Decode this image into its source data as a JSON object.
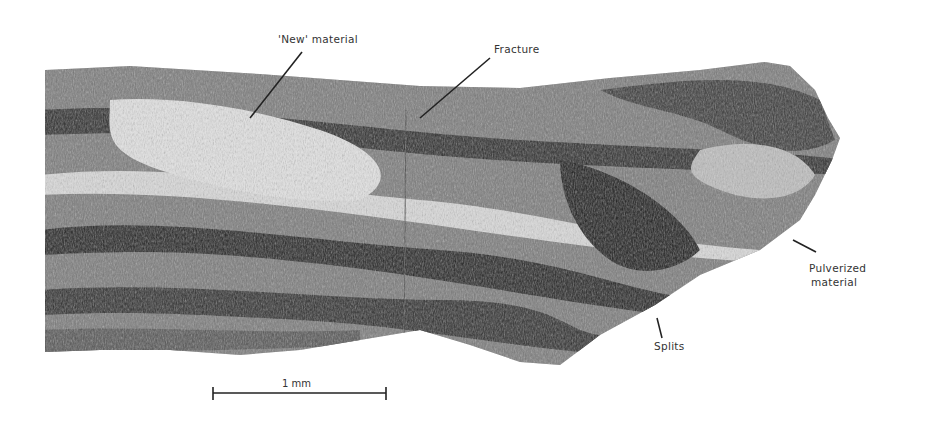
{
  "figure": {
    "labels": {
      "new_material": "'New' material",
      "fracture": "Fracture",
      "pulverized_line1": "Pulverized",
      "pulverized_line2": "material",
      "splits": "Splits"
    },
    "scale_bar": {
      "label": "1 mm"
    },
    "colors": {
      "background": "#ffffff",
      "specimen_dark": "#2a2a2a",
      "specimen_mid": "#6e6e6e",
      "specimen_light": "#cfcfcf",
      "line": "#222222"
    }
  }
}
